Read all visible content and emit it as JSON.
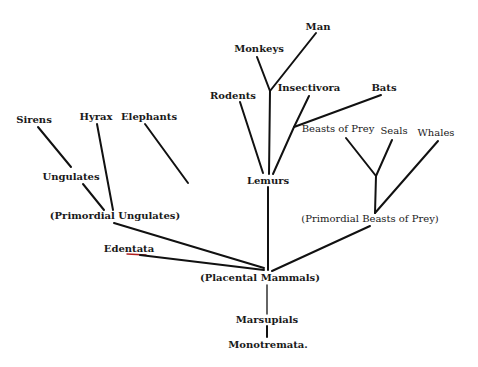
{
  "diagram": {
    "type": "phylogenetic-tree",
    "root": "Monotremata.",
    "nodes": {
      "man": "Man",
      "monkeys": "Monkeys",
      "insectivora": "Insectivora",
      "bats": "Bats",
      "rodents": "Rodents",
      "lemurs": "Lemurs",
      "beasts_of_prey": "Beasts of Prey",
      "seals": "Seals",
      "whales": "Whales",
      "primordial_beasts_of_prey": "(Primordial Beasts of Prey)",
      "sirens": "Sirens",
      "hyrax": "Hyrax",
      "elephants": "Elephants",
      "ungulates": "Ungulates",
      "primordial_ungulates": "(Primordial Ungulates)",
      "edentata": "Edentata",
      "placental_mammals": "(Placental Mammals)",
      "marsupials": "Marsupials",
      "monotremata": "Monotremata."
    },
    "edges": [
      [
        "monotremata",
        "marsupials"
      ],
      [
        "marsupials",
        "placental_mammals"
      ],
      [
        "placental_mammals",
        "lemurs"
      ],
      [
        "placental_mammals",
        "primordial_beasts_of_prey"
      ],
      [
        "placental_mammals",
        "primordial_ungulates"
      ],
      [
        "placental_mammals",
        "edentata"
      ],
      [
        "lemurs",
        "rodents"
      ],
      [
        "lemurs",
        "monkeys"
      ],
      [
        "lemurs",
        "man"
      ],
      [
        "lemurs",
        "insectivora"
      ],
      [
        "lemurs",
        "bats"
      ],
      [
        "primordial_beasts_of_prey",
        "beasts_of_prey"
      ],
      [
        "primordial_beasts_of_prey",
        "seals"
      ],
      [
        "primordial_beasts_of_prey",
        "whales"
      ],
      [
        "primordial_ungulates",
        "ungulates"
      ],
      [
        "primordial_ungulates",
        "hyrax"
      ],
      [
        "ungulates",
        "sirens"
      ],
      [
        "elephants",
        "elephants-unattached"
      ]
    ],
    "highlight_color": "#b01e1e"
  }
}
